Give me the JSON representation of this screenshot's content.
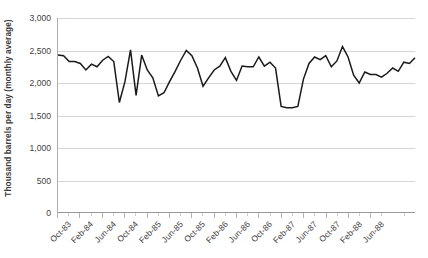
{
  "chart_data": {
    "type": "line",
    "title": "",
    "subtitle": "",
    "xlabel": "",
    "ylabel": "Thousand barrels per day (monthly average)",
    "ylim": [
      0,
      3000
    ],
    "y_ticks": [
      0,
      500,
      1000,
      1500,
      2000,
      2500,
      3000
    ],
    "y_tick_labels": [
      "0",
      "500",
      "1,000",
      "1,500",
      "2,000",
      "2,500",
      "3,000"
    ],
    "grid": "horizontal",
    "legend": "none",
    "line_color": "#1a1a1a",
    "gridline_color": "#d6d6d6",
    "background_color": "#ffffff",
    "x_tick_labels": [
      "Oct-83",
      "Feb-84",
      "Jun-84",
      "Oct-84",
      "Feb-85",
      "Jun-85",
      "Oct-85",
      "Feb-86",
      "Jun-86",
      "Oct-86",
      "Feb-87",
      "Jun-87",
      "Oct-87",
      "Feb-88",
      "Jun-88"
    ],
    "x_tick_interval_months": 4,
    "x_start": "Oct-83",
    "x_end": "Jun-88",
    "series": [
      {
        "name": "Crude oil production",
        "values": [
          2430,
          2420,
          2330,
          2330,
          2300,
          2200,
          2290,
          2250,
          2350,
          2410,
          2330,
          1700,
          2020,
          2510,
          1810,
          2430,
          2200,
          2080,
          1800,
          1850,
          2020,
          2180,
          2350,
          2500,
          2420,
          2230,
          1950,
          2080,
          2200,
          2260,
          2390,
          2180,
          2040,
          2260,
          2250,
          2250,
          2400,
          2260,
          2320,
          2230,
          1640,
          1620,
          1620,
          1640,
          2060,
          2300,
          2400,
          2360,
          2420,
          2250,
          2340,
          2560,
          2400,
          2120,
          2000,
          2170,
          2130,
          2130,
          2090,
          2150,
          2230,
          2180,
          2320,
          2300,
          2390
        ]
      }
    ],
    "min_value": 1620,
    "max_value": 2560
  }
}
